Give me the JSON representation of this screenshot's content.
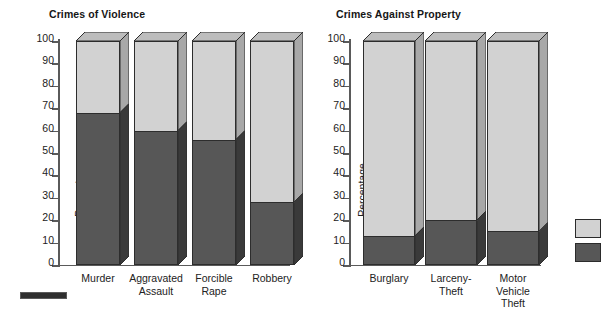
{
  "figure": {
    "background_color": "#ffffff",
    "series_colors": {
      "upper": "#d2d2d2",
      "upper_side": "#a8a8a8",
      "upper_top": "#bdbdbd",
      "lower": "#575757",
      "lower_side": "#3a3a3a",
      "outline": "#2d2d2d"
    }
  },
  "legend": {
    "name": "legend",
    "items": [
      {
        "key": "upper-swatch",
        "color": "#d2d2d2",
        "label": ""
      },
      {
        "key": "lower-swatch",
        "color": "#575757",
        "label": ""
      }
    ]
  },
  "axis": {
    "ylabel": "Percentage",
    "yticks": [
      "0",
      "10",
      "20",
      "30",
      "40",
      "50",
      "60",
      "70",
      "80",
      "90",
      "100"
    ],
    "ytick_values": [
      0,
      10,
      20,
      30,
      40,
      50,
      60,
      70,
      80,
      90,
      100
    ]
  },
  "chart_data": [
    {
      "type": "bar",
      "subtype": "stacked-3d",
      "title": "Crimes of Violence",
      "xlabel": "",
      "ylabel": "Percentage",
      "ylim": [
        0,
        100
      ],
      "ytick_step": 10,
      "grid": false,
      "legend_position": "right",
      "categories": [
        "Murder",
        "Aggravated\nAssault",
        "Forcible\nRape",
        "Robbery"
      ],
      "series": [
        {
          "name": "lower",
          "color": "#575757",
          "values": [
            68,
            60,
            56,
            28
          ]
        },
        {
          "name": "upper",
          "color": "#d2d2d2",
          "values": [
            32,
            40,
            44,
            72
          ]
        }
      ]
    },
    {
      "type": "bar",
      "subtype": "stacked-3d",
      "title": "Crimes Against Property",
      "xlabel": "",
      "ylabel": "Percentage",
      "ylim": [
        0,
        100
      ],
      "ytick_step": 10,
      "grid": false,
      "legend_position": "right",
      "categories": [
        "Burglary",
        "Larceny-\nTheft",
        "Motor\nVehicle\nTheft"
      ],
      "series": [
        {
          "name": "lower",
          "color": "#575757",
          "values": [
            13,
            20,
            15
          ]
        },
        {
          "name": "upper",
          "color": "#d2d2d2",
          "values": [
            87,
            80,
            85
          ]
        }
      ]
    }
  ]
}
